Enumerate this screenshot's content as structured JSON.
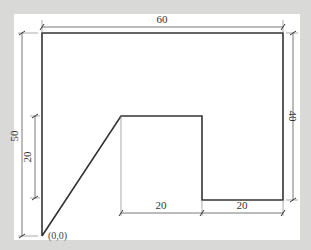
{
  "diagram": {
    "type": "engineering-drawing",
    "colors": {
      "background": "#d9d9d7",
      "paper": "#ffffff",
      "outline": "#333333",
      "dimension": "#555555"
    },
    "origin_label": "(0,0)",
    "dimensions": {
      "top_width": "60",
      "left_height": "50",
      "left_inner_height": "20",
      "right_height": "40",
      "bottom_middle_width": "20",
      "bottom_right_width": "20"
    },
    "shape_vertices": [
      {
        "x": 0,
        "y": 0
      },
      {
        "x": 10,
        "y": 20
      },
      {
        "x": 20,
        "y": 20
      },
      {
        "x": 40,
        "y": 20
      },
      {
        "x": 40,
        "y": 10
      },
      {
        "x": 60,
        "y": 10
      },
      {
        "x": 60,
        "y": 50
      },
      {
        "x": 0,
        "y": 50
      }
    ]
  }
}
